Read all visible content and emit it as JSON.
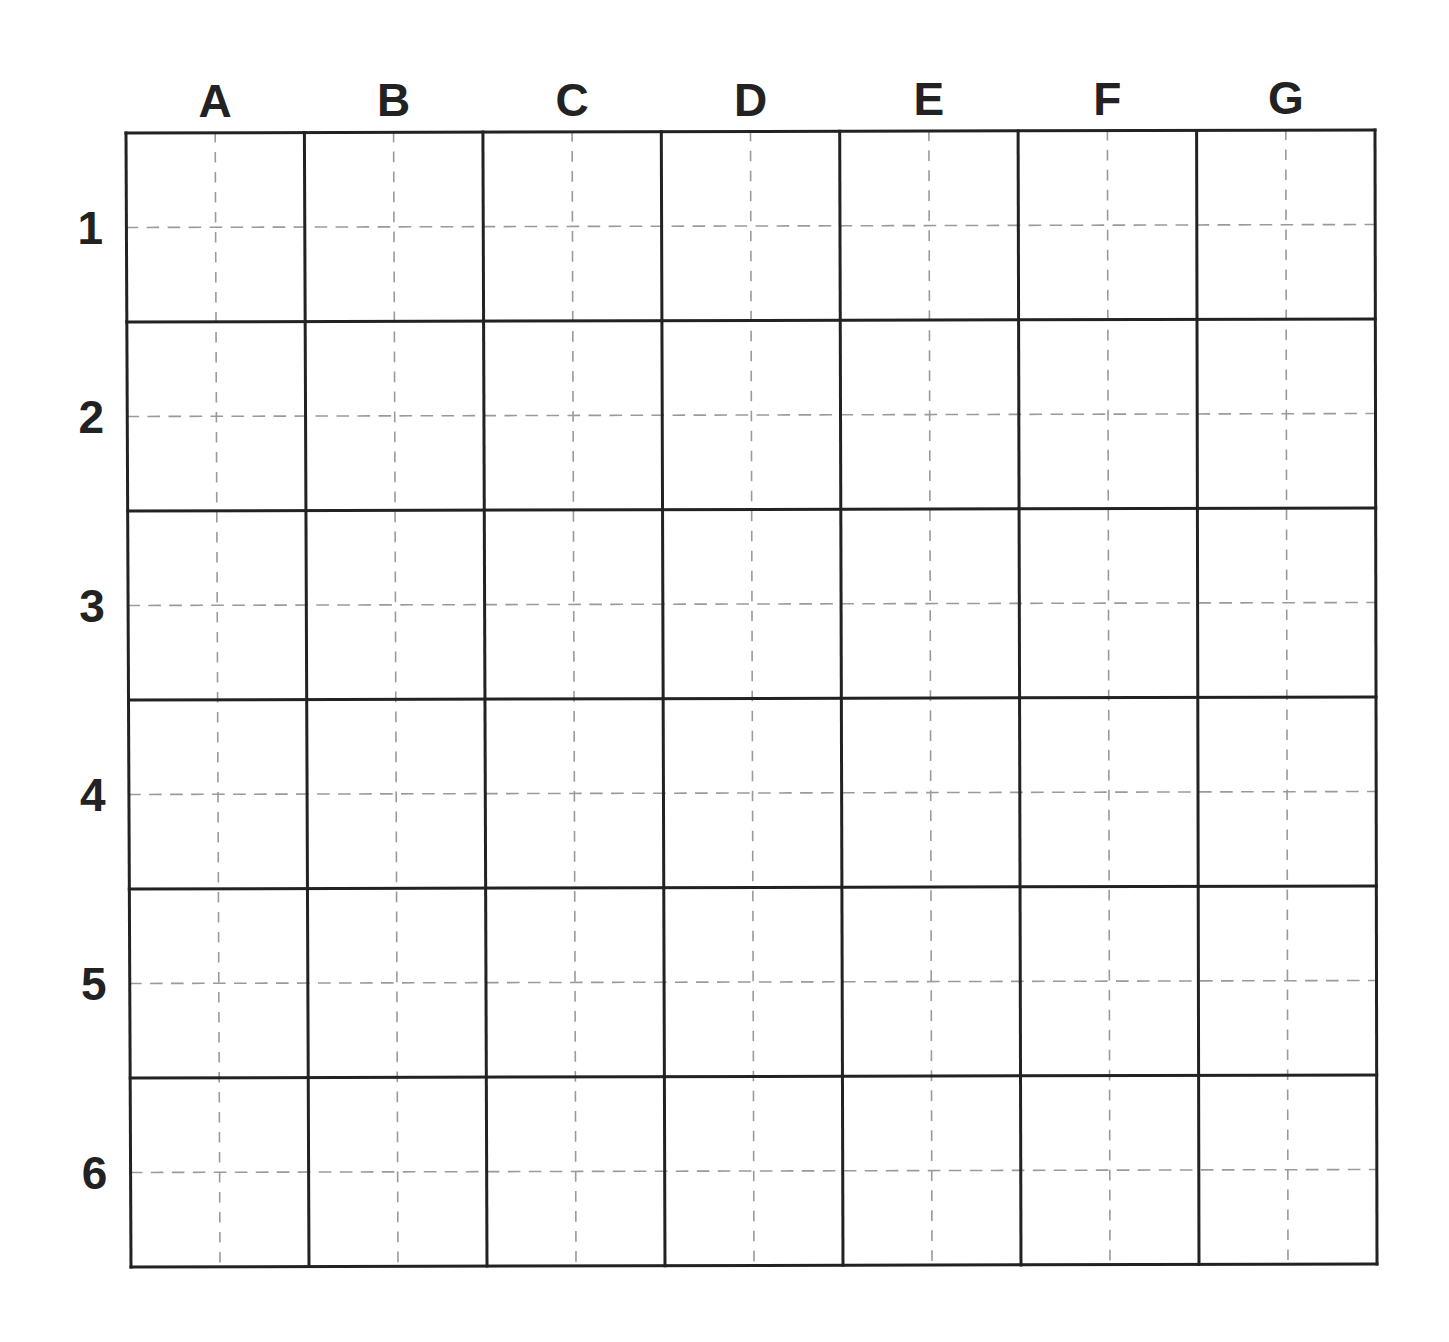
{
  "diagram": {
    "type": "grid",
    "columns": [
      "A",
      "B",
      "C",
      "D",
      "E",
      "F",
      "G"
    ],
    "rows": [
      "1",
      "2",
      "3",
      "4",
      "5",
      "6"
    ],
    "colors": {
      "cell_border": "#222222",
      "guide_dash": "#9a9a9a",
      "label": "#222222",
      "background": "#ffffff"
    }
  }
}
